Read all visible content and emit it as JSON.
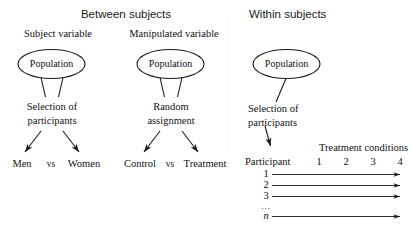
{
  "figure": {
    "type": "diagram",
    "subtype": "research-design-schematic",
    "background_color": "#ffffff",
    "stroke_color": "#1a1a1a"
  },
  "sections": {
    "between": {
      "heading": "Between subjects",
      "branches": [
        {
          "id": "subject-variable",
          "subtitle": "Subject variable",
          "node": "Population",
          "process_line1": "Selection of",
          "process_line2": "participants",
          "outcome_left": "Men",
          "outcome_connector": "vs",
          "outcome_right": "Women"
        },
        {
          "id": "manipulated-variable",
          "subtitle": "Manipulated variable",
          "node": "Population",
          "process_line1": "Random",
          "process_line2": "assignment",
          "outcome_left": "Control",
          "outcome_connector": "vs",
          "outcome_right": "Treatment"
        }
      ]
    },
    "within": {
      "heading": "Within subjects",
      "node": "Population",
      "process_line1": "Selection of",
      "process_line2": "participants",
      "matrix": {
        "row_header": "Participant",
        "column_group_label": "Treatment conditions",
        "columns": [
          "1",
          "2",
          "3",
          "4"
        ],
        "rows": [
          "1",
          "2",
          "3",
          "...",
          "n"
        ],
        "last_row_italic": true
      }
    }
  }
}
